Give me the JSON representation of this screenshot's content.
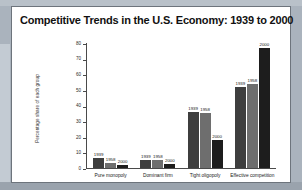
{
  "figure": {
    "title": "Competitive Trends in the U.S. Economy: 1939 to 2000"
  },
  "chart_data": {
    "type": "bar",
    "title": "Competitive Trends in the U.S. Economy: 1939 to 2000",
    "xlabel": "",
    "ylabel": "Percentage share of each group",
    "categories": [
      "Pure monopoly",
      "Dominant firm",
      "Tight oligopoly",
      "Effective competition"
    ],
    "series": [
      {
        "name": "1939",
        "values": [
          6.2,
          5.0,
          36.0,
          52.0
        ]
      },
      {
        "name": "1958",
        "values": [
          3.1,
          5.0,
          35.0,
          54.0
        ]
      },
      {
        "name": "2000",
        "values": [
          1.8,
          2.8,
          18.0,
          77.0
        ]
      }
    ],
    "ylim": [
      0,
      80
    ],
    "yticks": [
      0,
      10,
      20,
      30,
      40,
      50,
      60,
      70,
      80
    ],
    "ytick_labels": [
      "0",
      "10",
      "20",
      "30",
      "40",
      "50",
      "60",
      "70",
      "80"
    ],
    "grid": false,
    "legend": "none",
    "bar_labels_show_series_name": true,
    "colors": {
      "1939": "#3e3e3e",
      "1958": "#6e6e6e",
      "2000": "#1d1d1d",
      "panel_background": "#ffffff",
      "page_background": "#aab3bd",
      "axis": "#4a4a4a"
    }
  }
}
